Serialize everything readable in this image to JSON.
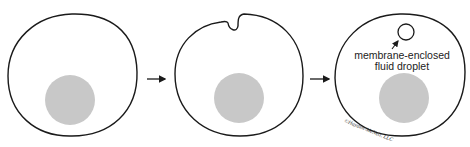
{
  "diagram": {
    "type": "process-sequence",
    "stages": [
      {
        "id": "cell-1",
        "description": "cell with nucleus"
      },
      {
        "id": "cell-2",
        "description": "cell membrane invaginating"
      },
      {
        "id": "cell-3",
        "description": "cell containing membrane-enclosed fluid droplet"
      }
    ],
    "label_line1": "membrane-enclosed",
    "label_line2": "fluid droplet",
    "credit": "©Hayden-McNeil, LLC",
    "colors": {
      "outline": "#1a1a1a",
      "nucleus": "#c8c8c8",
      "background": "#ffffff"
    }
  }
}
